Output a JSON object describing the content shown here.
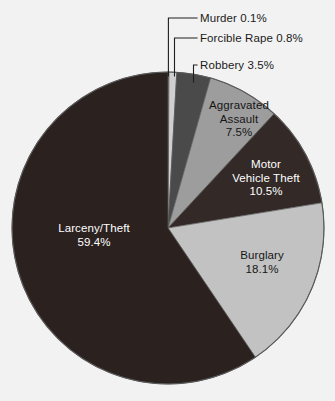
{
  "chart_data": {
    "type": "pie",
    "title": "",
    "categories": [
      "Murder",
      "Forcible Rape",
      "Robbery",
      "Aggravated Assault",
      "Motor Vehicle Theft",
      "Burglary",
      "Larceny/Theft"
    ],
    "values": [
      0.1,
      0.8,
      3.5,
      7.5,
      10.5,
      18.1,
      59.4
    ],
    "unit": "%",
    "legend_position": "none",
    "grid": false,
    "slices": [
      {
        "name": "Murder",
        "label": "Murder 0.1%",
        "value": 0.1,
        "value_text": "0.1%",
        "color": "#bdbdbd",
        "label_style": "callout",
        "text_color": "#1a1a1a"
      },
      {
        "name": "Forcible Rape",
        "label": "Forcible Rape 0.8%",
        "value": 0.8,
        "value_text": "0.8%",
        "color": "#cfcfcf",
        "label_style": "callout",
        "text_color": "#1a1a1a"
      },
      {
        "name": "Robbery",
        "label": "Robbery 3.5%",
        "value": 3.5,
        "value_text": "3.5%",
        "color": "#4a4a4a",
        "label_style": "callout",
        "text_color": "#1a1a1a"
      },
      {
        "name": "Aggravated Assault",
        "label_line1": "Aggravated",
        "label_line2": "Assault",
        "value": 7.5,
        "value_text": "7.5%",
        "color": "#9d9d9d",
        "label_style": "inside",
        "text_color": "#161616"
      },
      {
        "name": "Motor Vehicle Theft",
        "label_line1": "Motor",
        "label_line2": "Vehicle Theft",
        "value": 10.5,
        "value_text": "10.5%",
        "color": "#332a28",
        "label_style": "inside",
        "text_color": "#ffffff"
      },
      {
        "name": "Burglary",
        "label_line1": "Burglary",
        "value": 18.1,
        "value_text": "18.1%",
        "color": "#c2c2c2",
        "label_style": "inside",
        "text_color": "#161616"
      },
      {
        "name": "Larceny/Theft",
        "label_line1": "Larceny/Theft",
        "value": 59.4,
        "value_text": "59.4%",
        "color": "#2b2220",
        "label_style": "inside",
        "text_color": "#ffffff"
      }
    ],
    "background_color": "#f2f2f2",
    "outline_color": "#5a5a5a"
  }
}
